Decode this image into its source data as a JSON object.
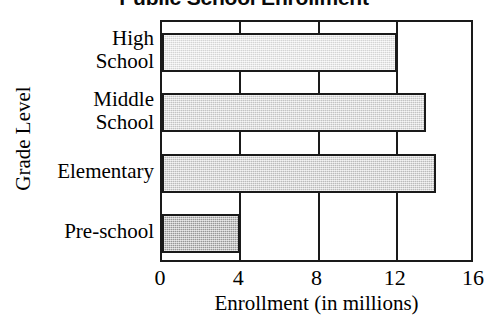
{
  "chart_data": {
    "type": "bar",
    "orientation": "horizontal",
    "title": "Public School Enrollment",
    "xlabel": "Enrollment (in millions)",
    "ylabel": "Grade Level",
    "categories": [
      "High School",
      "Middle School",
      "Elementary",
      "Pre-school"
    ],
    "values": [
      12,
      13.5,
      14,
      4
    ],
    "xlim": [
      0,
      16
    ],
    "xticks": [
      0,
      4,
      8,
      12,
      16
    ],
    "xtick_labels": [
      "0",
      "4",
      "8",
      "12",
      "16"
    ],
    "grid": true,
    "legend": "none",
    "bars": [
      {
        "category": "High School",
        "category_lines": [
          "High",
          "School"
        ],
        "value": 12,
        "fill": "#ebebeb"
      },
      {
        "category": "Middle School",
        "category_lines": [
          "Middle",
          "School"
        ],
        "value": 13.5,
        "fill": "#d8d8d8"
      },
      {
        "category": "Elementary",
        "category_lines": [
          "Elementary"
        ],
        "value": 14,
        "fill": "#d0d0d0"
      },
      {
        "category": "Pre-school",
        "category_lines": [
          "Pre-school"
        ],
        "value": 4,
        "fill": "#a8a8a8"
      }
    ],
    "colors": {
      "axis": "#1a1a1a",
      "background": "#ffffff",
      "text": "#000000"
    }
  }
}
